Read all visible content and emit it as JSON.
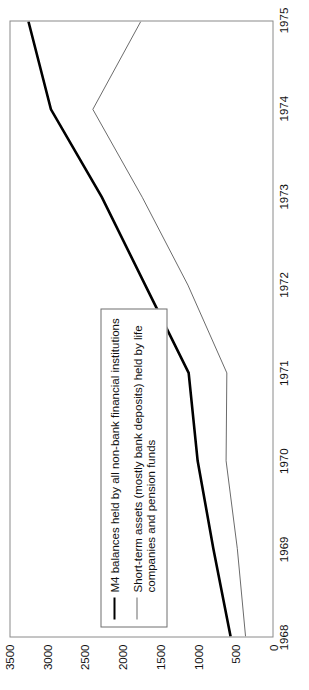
{
  "chart_data": {
    "type": "line",
    "title": "",
    "subtitle": "",
    "xlabel": "",
    "ylabel": "",
    "orientation": "rotated-90",
    "grid": false,
    "legend_position": "inside-lower-left",
    "x": [
      1968,
      1969,
      1970,
      1971,
      1972,
      1973,
      1974,
      1975
    ],
    "xtick_labels": [
      "1968",
      "1969",
      "1970",
      "1971",
      "1972",
      "1973",
      "1974",
      "1975"
    ],
    "xlim": [
      1968,
      1975
    ],
    "ytick_labels": [
      "0",
      "500",
      "1000",
      "1500",
      "2000",
      "2500",
      "3000",
      "3500"
    ],
    "ytick_values": [
      0,
      500,
      1000,
      1500,
      2000,
      2500,
      3000,
      3500
    ],
    "ylim": [
      0,
      3500
    ],
    "series": [
      {
        "name": "M4 balances held by all non-bank financial institutions",
        "style": "thick-black",
        "color": "#000000",
        "width": 2.6,
        "values": [
          560,
          790,
          1000,
          1120,
          1700,
          2280,
          2960,
          3260
        ]
      },
      {
        "name": "Short-term assets (mostly bank deposits) held by life companies and pension funds",
        "style": "thin-grey",
        "color": "#6b6b6b",
        "width": 1.0,
        "values": [
          360,
          470,
          620,
          610,
          1130,
          1740,
          2400,
          1760
        ]
      }
    ]
  },
  "legend": {
    "items": [
      {
        "swatch": "thick-line-swatch",
        "label": "M4 balances held by all non-bank financial institutions"
      },
      {
        "swatch": "thin-line-swatch",
        "label": "Short-term assets (mostly bank deposits) held by life\ncompanies and pension funds"
      }
    ]
  },
  "caption": ""
}
